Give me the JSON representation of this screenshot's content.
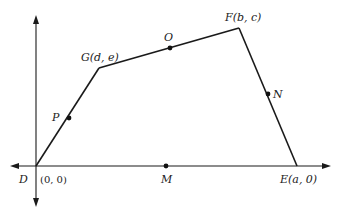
{
  "diagram": {
    "type": "coordinate-geometry-quadrilateral",
    "vertices": {
      "D": {
        "label": "D",
        "coords": "(0, 0)"
      },
      "E": {
        "label": "E",
        "coords": "(a, 0)"
      },
      "F": {
        "label": "F",
        "coords": "(b, c)"
      },
      "G": {
        "label": "G",
        "coords": "(d, e)"
      }
    },
    "midpoints": {
      "M": {
        "label": "M",
        "segment": "DE"
      },
      "N": {
        "label": "N",
        "segment": "EF"
      },
      "O": {
        "label": "O",
        "segment": "FG"
      },
      "P": {
        "label": "P",
        "segment": "GD"
      }
    },
    "labels": {
      "D": "D",
      "D_coords": "(0, 0)",
      "E": "E(a, 0)",
      "F": "F(b, c)",
      "G": "G(d, e)",
      "M": "M",
      "N": "N",
      "O": "O",
      "P": "P"
    }
  }
}
